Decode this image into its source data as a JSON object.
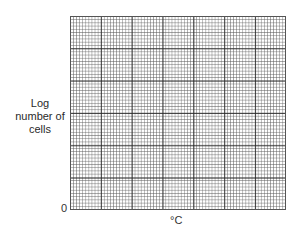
{
  "chart_data": {
    "type": "line",
    "title": "",
    "xlabel": "°C",
    "ylabel": "Log number of cells",
    "ylabel_lines": [
      "Log",
      "number of",
      "cells"
    ],
    "origin_tick": "0",
    "x_ticks": [],
    "y_ticks": [
      "0"
    ],
    "series": [],
    "grid": {
      "on": true,
      "major_columns": 7,
      "major_rows": 6,
      "minor_per_major": 10,
      "major_color": "#282828",
      "minor_color": "#5a5a5a"
    },
    "legend": null
  }
}
